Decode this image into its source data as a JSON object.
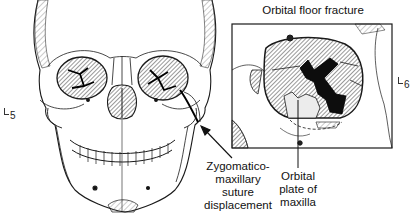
{
  "figure": {
    "type": "anatomical illustration",
    "inset": {
      "title": "Orbital floor fracture"
    },
    "labels": {
      "zygomatico": [
        "Zygomatico-",
        "maxillary",
        "suture",
        "displacement"
      ],
      "orbital_plate": [
        "Orbital",
        "plate of",
        "maxilla"
      ]
    },
    "figure_refs": {
      "left": "5",
      "right": "6"
    },
    "colors": {
      "line": "#1a1a1a",
      "shade": "#555555",
      "dark_fill": "#0d0d0d",
      "background": "#ffffff"
    }
  }
}
